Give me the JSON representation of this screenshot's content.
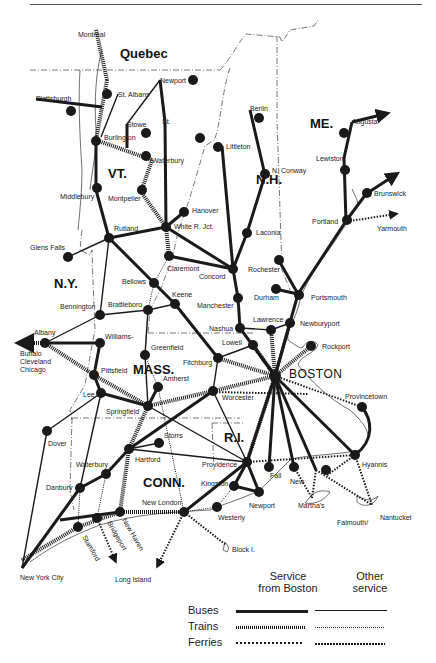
{
  "map": {
    "regions": [
      {
        "name": "Quebec",
        "x": 120,
        "y": 58
      },
      {
        "name": "VT.",
        "x": 108,
        "y": 178
      },
      {
        "name": "N.H.",
        "x": 256,
        "y": 184
      },
      {
        "name": "ME.",
        "x": 334,
        "y": 128
      },
      {
        "name": "N.Y.",
        "x": 54,
        "y": 288
      },
      {
        "name": "MASS.",
        "x": 133,
        "y": 374
      },
      {
        "name": "R.I.",
        "x": 224,
        "y": 442
      },
      {
        "name": "CONN.",
        "x": 143,
        "y": 487
      }
    ],
    "hub": {
      "name": "BOSTON",
      "x": 275,
      "y": 376
    },
    "cities": [
      {
        "name": "Montreal",
        "x": 92,
        "y": 37
      },
      {
        "name": "St. Albans",
        "x": 118,
        "y": 94
      },
      {
        "name": "Plattsburgh",
        "x": 36,
        "y": 99
      },
      {
        "name": "Newport",
        "x": 160,
        "y": 80
      },
      {
        "name": "Stowe",
        "x": 127,
        "y": 124
      },
      {
        "name": "St. Johnsbury",
        "x": 165,
        "y": 122
      },
      {
        "name": "Burlington",
        "x": 104,
        "y": 137
      },
      {
        "name": "Waterbury",
        "x": 152,
        "y": 160
      },
      {
        "name": "Littleton",
        "x": 222,
        "y": 146
      },
      {
        "name": "Berlin",
        "x": 250,
        "y": 110
      },
      {
        "name": "N. Conway",
        "x": 272,
        "y": 170
      },
      {
        "name": "Augusta",
        "x": 352,
        "y": 122
      },
      {
        "name": "Waterville Bangor Moncton",
        "x": 390,
        "y": 105
      },
      {
        "name": "Lewiston",
        "x": 344,
        "y": 158
      },
      {
        "name": "Camden Rockland Bangor",
        "x": 388,
        "y": 155
      },
      {
        "name": "Brunswick",
        "x": 366,
        "y": 194
      },
      {
        "name": "Portland",
        "x": 346,
        "y": 221
      },
      {
        "name": "Yarmouth",
        "x": 381,
        "y": 229
      },
      {
        "name": "Middlebury",
        "x": 96,
        "y": 190
      },
      {
        "name": "Montpelier",
        "x": 141,
        "y": 192
      },
      {
        "name": "Hanover",
        "x": 184,
        "y": 212
      },
      {
        "name": "White R. Jct.",
        "x": 166,
        "y": 227
      },
      {
        "name": "Laconia",
        "x": 247,
        "y": 233
      },
      {
        "name": "Rutland",
        "x": 109,
        "y": 238
      },
      {
        "name": "Glens Falls",
        "x": 68,
        "y": 257
      },
      {
        "name": "Claremont",
        "x": 169,
        "y": 256
      },
      {
        "name": "Concord",
        "x": 233,
        "y": 269
      },
      {
        "name": "Rochester",
        "x": 278,
        "y": 259
      },
      {
        "name": "Bellows Falls",
        "x": 154,
        "y": 283
      },
      {
        "name": "Keene",
        "x": 175,
        "y": 304
      },
      {
        "name": "Durham",
        "x": 275,
        "y": 289
      },
      {
        "name": "Portsmouth",
        "x": 298,
        "y": 294
      },
      {
        "name": "Manchester",
        "x": 238,
        "y": 298
      },
      {
        "name": "Bennington",
        "x": 100,
        "y": 315
      },
      {
        "name": "Brattleboro",
        "x": 148,
        "y": 310
      },
      {
        "name": "Lawrence",
        "x": 271,
        "y": 330
      },
      {
        "name": "Newburyport",
        "x": 290,
        "y": 323
      },
      {
        "name": "Nashua",
        "x": 240,
        "y": 328
      },
      {
        "name": "Albany",
        "x": 45,
        "y": 343
      },
      {
        "name": "Williamstown",
        "x": 100,
        "y": 343
      },
      {
        "name": "Lowell",
        "x": 253,
        "y": 345
      },
      {
        "name": "Rockport",
        "x": 311,
        "y": 346
      },
      {
        "name": "Greenfield",
        "x": 145,
        "y": 355
      },
      {
        "name": "Fitchburg",
        "x": 218,
        "y": 358
      },
      {
        "name": "Buffalo Cleveland Chicago",
        "x": 18,
        "y": 343
      },
      {
        "name": "Pittsfield",
        "x": 94,
        "y": 375
      },
      {
        "name": "Amherst",
        "x": 158,
        "y": 387
      },
      {
        "name": "Worcester",
        "x": 213,
        "y": 391
      },
      {
        "name": "Provincetown",
        "x": 362,
        "y": 407
      },
      {
        "name": "Lee",
        "x": 101,
        "y": 393
      },
      {
        "name": "Springfield",
        "x": 148,
        "y": 406
      },
      {
        "name": "Dover Plains",
        "x": 47,
        "y": 431
      },
      {
        "name": "Storrs",
        "x": 159,
        "y": 443
      },
      {
        "name": "Hartford",
        "x": 129,
        "y": 449
      },
      {
        "name": "Providence",
        "x": 247,
        "y": 462
      },
      {
        "name": "Fall River",
        "x": 269,
        "y": 467
      },
      {
        "name": "New Bedford",
        "x": 294,
        "y": 467
      },
      {
        "name": "Hyannis",
        "x": 355,
        "y": 455
      },
      {
        "name": "Falmouth/Woods Hole",
        "x": 326,
        "y": 467
      },
      {
        "name": "Waterbury (CT)",
        "x": 106,
        "y": 474
      },
      {
        "name": "Kingston",
        "x": 234,
        "y": 486
      },
      {
        "name": "Newport (RI)",
        "x": 259,
        "y": 492
      },
      {
        "name": "Danbury",
        "x": 80,
        "y": 488
      },
      {
        "name": "Martha's Vineyard",
        "x": 312,
        "y": 505
      },
      {
        "name": "Nantucket",
        "x": 375,
        "y": 518
      },
      {
        "name": "New London",
        "x": 184,
        "y": 512
      },
      {
        "name": "Westerly",
        "x": 217,
        "y": 507
      },
      {
        "name": "New Haven",
        "x": 120,
        "y": 512
      },
      {
        "name": "Bridgeport",
        "x": 97,
        "y": 518
      },
      {
        "name": "Stamford",
        "x": 78,
        "y": 527
      },
      {
        "name": "Block I.",
        "x": 229,
        "y": 548
      },
      {
        "name": "New York City",
        "x": 22,
        "y": 568
      },
      {
        "name": "Long Island",
        "x": 115,
        "y": 568
      }
    ]
  },
  "legend": {
    "col1_heading_line1": "Service",
    "col1_heading_line2": "from Boston",
    "col2_heading_line1": "Other",
    "col2_heading_line2": "service",
    "rows": [
      {
        "label": "Buses",
        "style": "solid"
      },
      {
        "label": "Trains",
        "style": "hatched"
      },
      {
        "label": "Ferries",
        "style": "dotted"
      }
    ]
  },
  "colors": {
    "ink": "#1a1a1a",
    "paper": "#ffffff",
    "border": "#555555"
  }
}
